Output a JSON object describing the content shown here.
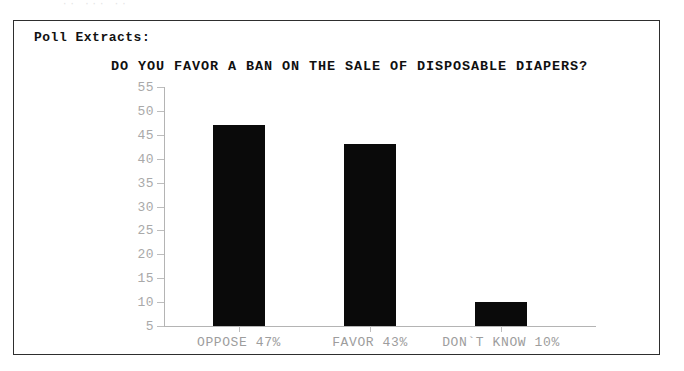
{
  "scan_artifact": {
    "ghost_text": "·· ···  ··"
  },
  "panel": {
    "heading": "Poll Extracts:"
  },
  "chart_data": {
    "type": "bar",
    "title": "DO YOU FAVOR A BAN ON THE SALE OF DISPOSABLE DIAPERS?",
    "xlabel": "",
    "ylabel": "",
    "categories": [
      "OPPOSE 47%",
      "FAVOR 43%",
      "DON`T KNOW 10%"
    ],
    "values": [
      47,
      43,
      10
    ],
    "ylim": [
      5,
      55
    ],
    "yticks": [
      55,
      50,
      45,
      40,
      35,
      30,
      25,
      20,
      15,
      10,
      5
    ],
    "ytick_labels": [
      "55",
      "50",
      "45",
      "40",
      "35",
      "30",
      "25",
      "20",
      "15",
      "10",
      "5"
    ],
    "grid": false,
    "legend": false,
    "bar_color": "#0a0a0a",
    "axis_color": "#b4b4b4",
    "tick_label_color": "#a9a9a9"
  }
}
